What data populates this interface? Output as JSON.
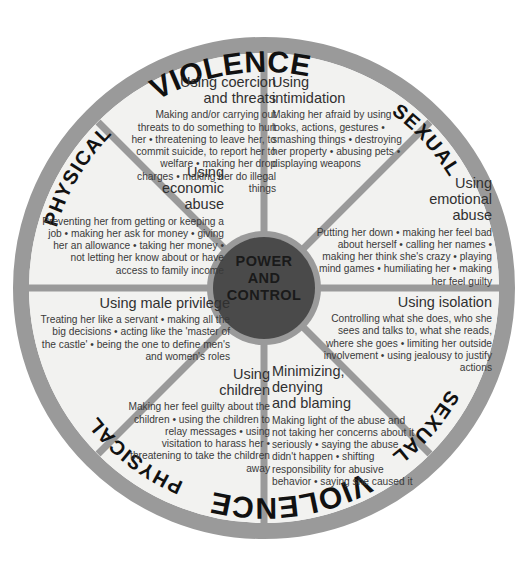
{
  "diagram": {
    "hub": {
      "line1": "POWER",
      "line2": "AND",
      "line3": "CONTROL"
    },
    "ring": {
      "top_left": "PHYSICAL",
      "top_center": "VIOLENCE",
      "top_right": "SEXUAL",
      "bottom_left": "PHYSICAL",
      "bottom_center": "VIOLENCE",
      "bottom_right": "SEXUAL"
    },
    "colors": {
      "ring": "#9a9a9a",
      "spoke": "#9a9a9a",
      "hub": "#4a4a4a",
      "segment_fill": "#f2f2f0",
      "text": "#3a3a3a",
      "background": "#ffffff"
    },
    "segments": [
      {
        "id": "coercion",
        "heading": "Using coercion\nand threats",
        "body": "Making and/or carrying out threats to do something to hurt her • threatening to leave her, to commit suicide, to report her to welfare • making her drop charges • making her do illegal things",
        "align": "right"
      },
      {
        "id": "intimidation",
        "heading": "Using\nintimidation",
        "body": "Making her afraid by using looks, actions, gestures • smashing things • destroying her property • abusing pets • displaying weapons",
        "align": "left"
      },
      {
        "id": "economic",
        "heading": "Using\neconomic\nabuse",
        "body": "Preventing her from getting or keeping a job • making her ask for money • giving her an allowance • taking her money • not letting her know about or have access to family income",
        "align": "right"
      },
      {
        "id": "emotional",
        "heading": "Using\nemotional\nabuse",
        "body": "Putting her down • making her feel bad about herself • calling her names • making her think she's crazy • playing mind games • humiliating her • making her feel guilty",
        "align": "right"
      },
      {
        "id": "male-privilege",
        "heading": "Using male privilege",
        "body": "Treating her like a servant • making all the big decisions • acting like the 'master of the castle' • being the one to define men's and women's roles",
        "align": "right"
      },
      {
        "id": "isolation",
        "heading": "Using isolation",
        "body": "Controlling what she does, who she sees and talks to, what she reads, where she goes • limiting her outside involvement • using jealousy to justify actions",
        "align": "right"
      },
      {
        "id": "children",
        "heading": "Using\nchildren",
        "body": "Making her feel guilty about the children • using the children to relay messages • using visitation to harass her • threatening to take the children away",
        "align": "right"
      },
      {
        "id": "minimizing",
        "heading": "Minimizing,\ndenying\nand blaming",
        "body": "Making light of the abuse and not taking her concerns about it seriously • saying the abuse didn't happen • shifting responsibility for abusive behavior • saying she caused it",
        "align": "left"
      }
    ]
  }
}
